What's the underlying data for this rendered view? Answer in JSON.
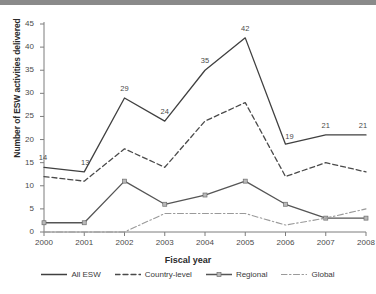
{
  "figure": {
    "top_bar_color": "#8a8a8a",
    "background": "#ffffff"
  },
  "chart_data": {
    "type": "line",
    "title": "",
    "xlabel": "Fiscal year",
    "ylabel": "Number of ESW activities delivered",
    "categories": [
      "2000",
      "2001",
      "2002",
      "2003",
      "2004",
      "2005",
      "2006",
      "2007",
      "2008"
    ],
    "x": [
      2000,
      2001,
      2002,
      2003,
      2004,
      2005,
      2006,
      2007,
      2008
    ],
    "ylim": [
      0,
      45
    ],
    "yticks": [
      0,
      5,
      10,
      15,
      20,
      25,
      30,
      35,
      40,
      45
    ],
    "ytick_labels": [
      "0",
      "5",
      "10",
      "15",
      "20",
      "25",
      "30",
      "35",
      "40",
      "45"
    ],
    "grid": false,
    "legend_position": "bottom",
    "series": [
      {
        "name": "All ESW",
        "style": "solid",
        "color": "#404040",
        "values": [
          14,
          13,
          29,
          24,
          35,
          42,
          19,
          21,
          21
        ],
        "data_labels": [
          "14",
          "13",
          "29",
          "24",
          "35",
          "42",
          "19",
          "21",
          "21"
        ]
      },
      {
        "name": "Country-level",
        "style": "dashed",
        "color": "#4a4a4a",
        "values": [
          12,
          11,
          18,
          14,
          24,
          28,
          12,
          15,
          13
        ],
        "data_labels": []
      },
      {
        "name": "Regional",
        "style": "solid-marker",
        "color": "#555555",
        "values": [
          2,
          2,
          11,
          6,
          8,
          11,
          6,
          3,
          3
        ],
        "data_labels": []
      },
      {
        "name": "Global",
        "style": "dashdot",
        "color": "#9a9a9a",
        "values": [
          0,
          0,
          0,
          4,
          4,
          4,
          1.5,
          3,
          5
        ],
        "data_labels": []
      }
    ]
  }
}
